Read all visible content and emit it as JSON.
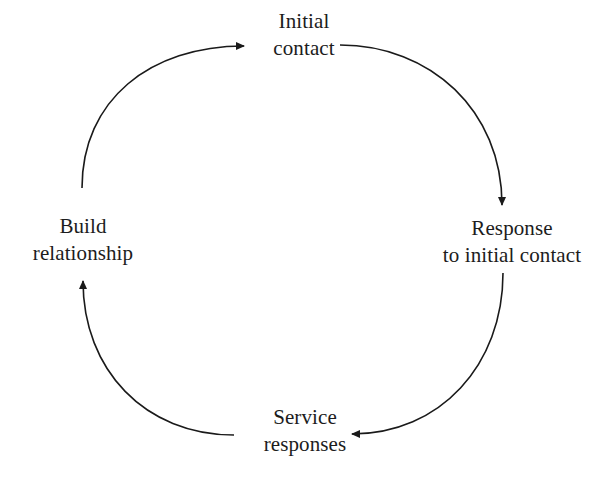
{
  "diagram": {
    "type": "cycle",
    "direction": "clockwise",
    "nodes": [
      {
        "id": "initial-contact",
        "lines": [
          "Initial",
          "contact"
        ]
      },
      {
        "id": "response-to-initial-contact",
        "lines": [
          "Response",
          "to initial contact"
        ]
      },
      {
        "id": "service-responses",
        "lines": [
          "Service",
          "responses"
        ]
      },
      {
        "id": "build-relationship",
        "lines": [
          "Build",
          "relationship"
        ]
      }
    ],
    "edges": [
      {
        "from": "initial-contact",
        "to": "response-to-initial-contact"
      },
      {
        "from": "response-to-initial-contact",
        "to": "service-responses"
      },
      {
        "from": "service-responses",
        "to": "build-relationship"
      },
      {
        "from": "build-relationship",
        "to": "initial-contact"
      }
    ],
    "colors": {
      "stroke": "#1a1a1a",
      "text": "#1c1c1c",
      "background": "#ffffff"
    }
  }
}
